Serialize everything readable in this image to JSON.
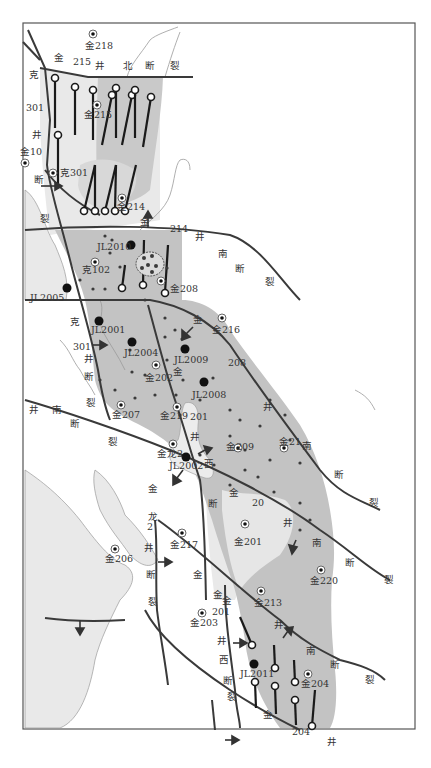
{
  "figure": {
    "title": "",
    "frame": {
      "x": 23,
      "y": 23,
      "width": 392,
      "height": 706
    },
    "colors": {
      "background": "#ffffff",
      "light_area": "#e9e9e9",
      "mid_area": "#c9c9c9",
      "dark_area": "#b7b7b7",
      "fault_line": "#3a3a3a",
      "river": "#9a9a9a",
      "frame": "#555555"
    }
  },
  "faults": [
    {
      "name": "金215井北断裂",
      "chars": [
        "金",
        "215",
        "井",
        "北",
        "断",
        "裂"
      ]
    },
    {
      "name": "克301井断裂",
      "chars": [
        "克",
        "301",
        "井",
        "断",
        "裂"
      ]
    },
    {
      "name": "金214井南断裂",
      "chars": [
        "金",
        "214",
        "井",
        "南",
        "断",
        "裂"
      ]
    },
    {
      "name": "金208井南断裂",
      "chars": [
        "金",
        "208",
        "井",
        "南",
        "断",
        "裂"
      ]
    },
    {
      "name": "金201井南断裂",
      "chars": [
        "金",
        "201",
        "井",
        "南",
        "断",
        "裂"
      ]
    },
    {
      "name": "金龙2井断裂",
      "chars": [
        "金",
        "龙",
        "2",
        "井",
        "断",
        "裂"
      ]
    },
    {
      "name": "金201井西断裂",
      "chars": [
        "金",
        "201",
        "井",
        "西",
        "断",
        "裂"
      ]
    },
    {
      "name": "金204井南断裂",
      "chars": [
        "金",
        "204",
        "井",
        "南",
        "断",
        "裂"
      ]
    }
  ],
  "wells": {
    "jin218": "金218",
    "jin215": "金215",
    "jin10": "金10",
    "ke301": "克301",
    "jin214": "金214",
    "jl2010": "JL2010",
    "ke102": "克102",
    "jin208": "金208",
    "jl2005": "JL2005",
    "jl2001": "JL2001",
    "jl2004": "JL2004",
    "jin216": "金216",
    "jl2009": "JL2009",
    "jin202": "金202",
    "jl2008": "JL2008",
    "jin207": "金207",
    "jin219": "金219",
    "jin209": "金209",
    "jin21": "金21",
    "jinlong2": "金龙2",
    "jl2002": "JL2002",
    "jin201": "金201",
    "jin217": "金217",
    "jin206": "金206",
    "jin220": "金220",
    "jin213": "金213",
    "jin203": "金203",
    "jl2011": "JL2011",
    "jin204": "金204"
  },
  "fault_labels": {
    "f1_jin": "金",
    "f1_215": "215",
    "f1_jing": "井",
    "f1_bei": "北",
    "f1_duan": "断",
    "f1_lie": "裂",
    "f2_ke": "克",
    "f2_301": "301",
    "f2_jing": "井",
    "f2_duan": "断",
    "f2_lie": "裂",
    "f3_jin": "金",
    "f3_214": "214",
    "f3_jing": "井",
    "f3_nan": "南",
    "f3_duan": "断",
    "f3_lie": "裂",
    "f4_ke": "克",
    "f4_301": "301",
    "f4_jing": "井",
    "f4_duan": "断",
    "f4_lie": "裂",
    "f5_jin": "金",
    "f5_208": "208",
    "f5_jing": "井",
    "f5_nan": "南",
    "f5_duan": "断",
    "f5_lie": "裂",
    "f6_jing": "井",
    "f6_nan": "南",
    "f6_duan": "断",
    "f6_lie": "裂",
    "f7_jin": "金",
    "f7_201": "201",
    "f7_jing": "井",
    "f7_xi": "西",
    "f7_duan": "断",
    "f8_jin": "金",
    "f8_20": "20",
    "f8_jing": "井",
    "f8_nan": "南",
    "f8_duan": "断",
    "f8_lie": "裂",
    "f9_jin": "金",
    "f9_long": "龙",
    "f9_2": "2",
    "f9_jing": "井",
    "f9_duan": "断",
    "f9_lie": "裂",
    "f10_jin": "金",
    "f10_jin2": "金",
    "f10_201": "201",
    "f10_jing": "井",
    "f10_xi": "西",
    "f10_duan": "断",
    "f10_lie": "裂",
    "f11_jin": "金",
    "f11_jing": "井",
    "f11_nan": "南",
    "f11_duan": "断",
    "f11_lie": "裂",
    "f12_jin": "金",
    "f12_204": "204",
    "f12_jing": "井",
    "f13_jin": "金"
  },
  "caption": ""
}
